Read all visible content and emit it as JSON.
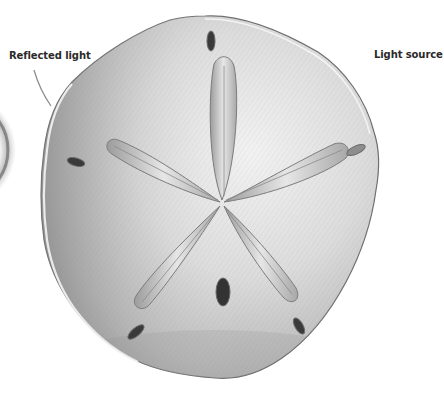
{
  "illustration": {
    "subject": "Sand dollar pencil drawing",
    "annotations": [
      {
        "id": "reflected",
        "text": "Reflected light"
      },
      {
        "id": "source",
        "text": "Light source"
      }
    ]
  },
  "colors": {
    "background": "#ffffff",
    "label_text": "#2a2a2a",
    "pointer_line": "#8a8a8a",
    "body_light": "#e9e9e9",
    "body_mid": "#c8c8c8",
    "body_dark": "#8f8f8f",
    "slot_dark": "#2e2e2e",
    "rim_highlight": "#f6f6f6"
  }
}
